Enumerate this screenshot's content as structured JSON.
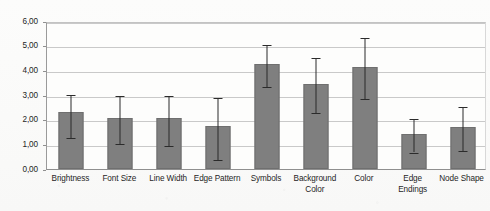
{
  "chart_data": {
    "type": "bar",
    "title": "",
    "subtitle": "",
    "xlabel": "",
    "ylabel": "",
    "ylim": [
      0,
      6
    ],
    "ytick_step": 1,
    "grid": true,
    "legend": null,
    "decimal_separator": ",",
    "error_bars": true,
    "bar_color": "#7f7f7f",
    "error_bar_color": "#2b2b2b",
    "gridline_color": "#c9c9c9",
    "axis_color": "#8f8f8f",
    "background_color": "#fbfbfa",
    "ytick_labels": [
      "0,00",
      "1,00",
      "2,00",
      "3,00",
      "4,00",
      "5,00",
      "6,00"
    ],
    "ytick_values": [
      0,
      1,
      2,
      3,
      4,
      5,
      6
    ],
    "categories": [
      "Brightness",
      "Font Size",
      "Line Width",
      "Edge Pattern",
      "Symbols",
      "Background Color",
      "Color",
      "Edge Endings",
      "Node Shape"
    ],
    "values": [
      2.3,
      2.05,
      2.05,
      1.75,
      4.25,
      3.45,
      4.15,
      1.4,
      1.7
    ],
    "error_low": [
      1.35,
      1.1,
      1.0,
      0.45,
      3.4,
      2.35,
      2.9,
      0.75,
      0.8
    ],
    "error_high": [
      3.1,
      3.05,
      3.05,
      2.95,
      5.1,
      4.6,
      5.4,
      2.1,
      2.6
    ],
    "series": [
      {
        "name": "Mean rating",
        "values": [
          2.3,
          2.05,
          2.05,
          1.75,
          4.25,
          3.45,
          4.15,
          1.4,
          1.7
        ]
      }
    ]
  }
}
